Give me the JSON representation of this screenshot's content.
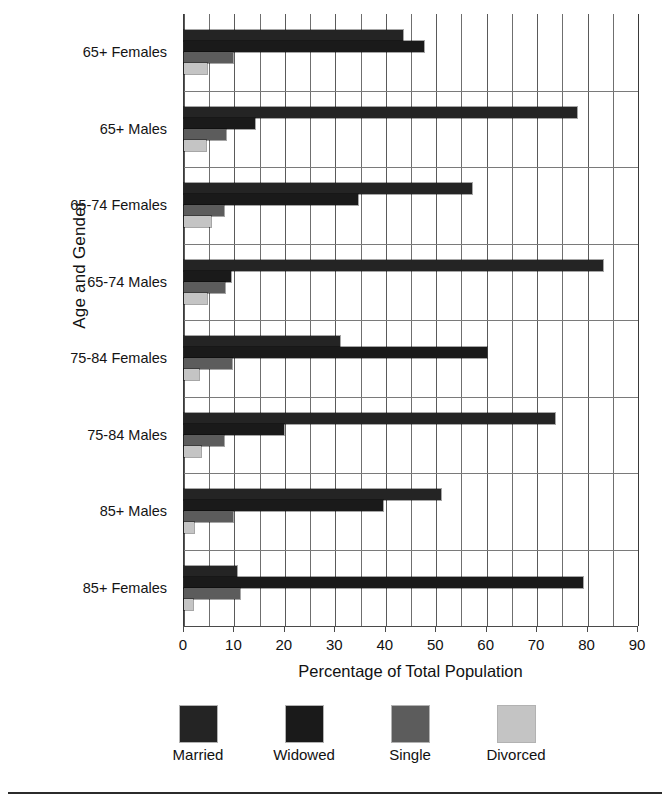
{
  "chart_data": {
    "type": "bar",
    "orientation": "horizontal",
    "title": "",
    "xlabel": "Percentage of Total Population",
    "ylabel": "Age and Gender",
    "xlim": [
      0,
      90
    ],
    "xticks": [
      0,
      10,
      20,
      30,
      40,
      50,
      60,
      70,
      80,
      90
    ],
    "xtick_labels": [
      "0",
      "10",
      "20",
      "30",
      "40",
      "50",
      "60",
      "70",
      "80",
      "90"
    ],
    "gridline_step": 5,
    "grid": true,
    "legend_position": "bottom",
    "categories": [
      "65+ Females",
      "65+ Males",
      "65-74 Females",
      "65-74 Males",
      "75-84 Females",
      "75-84 Males",
      "85+ Males",
      "85+ Females"
    ],
    "series": [
      {
        "name": "Married",
        "color": "#242424",
        "values": [
          43.5,
          78.0,
          57.0,
          83.0,
          31.0,
          73.5,
          51.0,
          10.5
        ]
      },
      {
        "name": "Widowed",
        "color": "#1a1a1a",
        "values": [
          47.5,
          14.0,
          34.5,
          9.3,
          60.0,
          19.8,
          39.5,
          79.0
        ]
      },
      {
        "name": "Single",
        "color": "#5c5c5c",
        "values": [
          9.7,
          8.3,
          8.0,
          8.1,
          9.5,
          8.0,
          9.7,
          11.2
        ]
      },
      {
        "name": "Divorced",
        "color": "#c4c4c4",
        "values": [
          4.5,
          4.3,
          5.3,
          4.5,
          3.0,
          3.4,
          2.0,
          1.8
        ]
      }
    ]
  },
  "legend": {
    "entries": [
      {
        "label": "Married",
        "color": "#242424"
      },
      {
        "label": "Widowed",
        "color": "#1a1a1a"
      },
      {
        "label": "Single",
        "color": "#5c5c5c"
      },
      {
        "label": "Divorced",
        "color": "#c4c4c4"
      }
    ]
  }
}
